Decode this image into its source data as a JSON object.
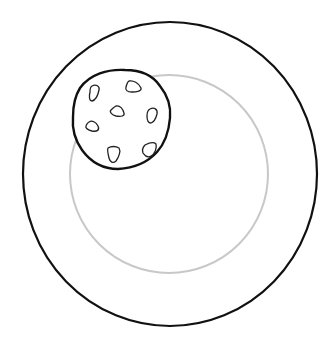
{
  "scene": {
    "description": "Line drawing of a chocolate chip cookie on a plate",
    "background": "#ffffff",
    "plate": {
      "outer_rim": {
        "cx": 170,
        "cy": 174,
        "rx": 147,
        "ry": 152,
        "stroke": "#111111",
        "stroke_width": 2.2
      },
      "inner_well": {
        "cx": 169,
        "cy": 174,
        "r": 99,
        "stroke": "#c8c8c8",
        "stroke_width": 2
      }
    },
    "cookie": {
      "cx": 122,
      "cy": 119,
      "r": 49,
      "stroke": "#111111",
      "stroke_width": 2.4,
      "chip_count": 7,
      "chips": [
        {
          "x": 95,
          "y": 95
        },
        {
          "x": 133,
          "y": 86
        },
        {
          "x": 116,
          "y": 112
        },
        {
          "x": 152,
          "y": 115
        },
        {
          "x": 92,
          "y": 127
        },
        {
          "x": 113,
          "y": 154
        },
        {
          "x": 148,
          "y": 150
        }
      ]
    }
  }
}
